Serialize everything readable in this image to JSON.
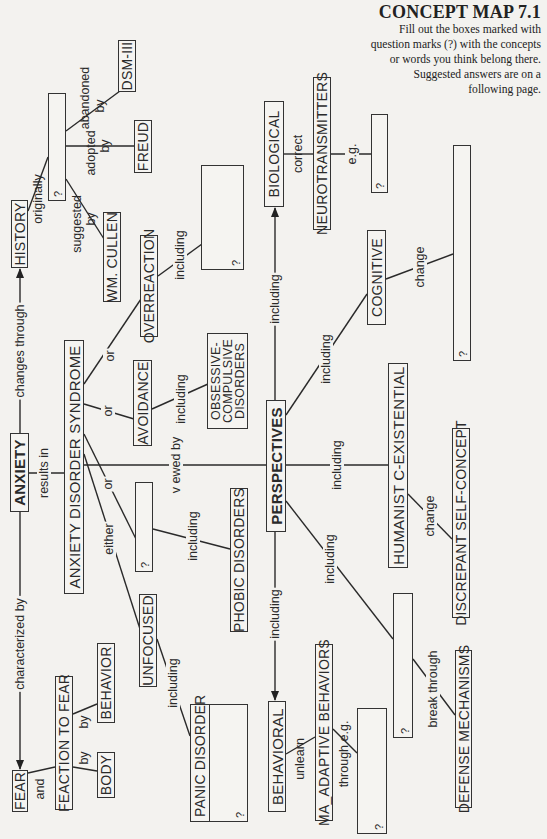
{
  "header": {
    "title": "CONCEPT MAP 7.1",
    "instructions": [
      "Fill out the boxes marked with",
      "question marks (?) with the concepts",
      "or words you think belong there.",
      "Suggested answers are on a",
      "following page."
    ]
  },
  "blank_marker": "?",
  "nodes": {
    "anxiety": "ANXIETY",
    "history": "HISTORY",
    "fear": "FEAR",
    "reaction_to_fear": "FEACTION TO FEAR",
    "behavior": "BEHAVIOR",
    "body": "BODY",
    "anxiety_disorder_syndrome": "ANXIETY DISORDER SYNDROME",
    "dsm_iii": "DSM-III",
    "freud": "FREUD",
    "wm_cullen": "WM. CULLEN",
    "overreaction": "OVERREACTION",
    "avoidance": "AVOIDANCE",
    "ocd": [
      "OBSESSIVE-",
      "COMPULSIVE",
      "DISORDERS"
    ],
    "phobic_disorders": "PHOBIC DISORDERS",
    "unfocused": "UNFOCUSED",
    "panic_disorder": "PANIC  DISORDER",
    "perspectives": "PERSPECTIVES",
    "biological": "BIOLOGICAL",
    "neurotransmitters": "NEUROTRANSMITTERS",
    "cognitive": "COGNITIVE",
    "humanistic_existential": "HUMANIST C-EXISTENTIAL",
    "discrepant_self_concept": "DISCREPANT SELF-CONCEPT",
    "behavioral": "BEHAVIORAL",
    "maladaptive_behaviors": "MA_ADAPTIVE BEHAVIORS",
    "defense_mechanisms": "DEFENSE MECHANISMS"
  },
  "links": {
    "characterized_by": "characterized by",
    "changes_through": "changes through",
    "results_in": "results in",
    "and": "and",
    "by_behavior": "by",
    "by_body": "by",
    "originally": "originally",
    "suggested": "suggested",
    "suggested_by": "by",
    "adopted": "adopted",
    "adopted_by": "by",
    "abandoned": "abandoned",
    "abandoned_by": "by",
    "or_overreaction": "or",
    "or_avoidance": "or",
    "or_blank": "or",
    "either": "either",
    "including_overreaction": "including",
    "including_avoidance": "including",
    "including_phobic": "including",
    "including_unfocused": "including",
    "viewed_by": "v ewed by",
    "including_biological": "including",
    "including_cognitive": "including",
    "including_humanistic": "including",
    "including_psychodynamic": "including",
    "including_behavioral": "including",
    "correct": "correct",
    "eg": "e.g.",
    "change_cognitive": "change",
    "change_humanistic": "change",
    "unlearn": "unlearn",
    "through_eg": "through e.g.",
    "break_through": "break through"
  }
}
